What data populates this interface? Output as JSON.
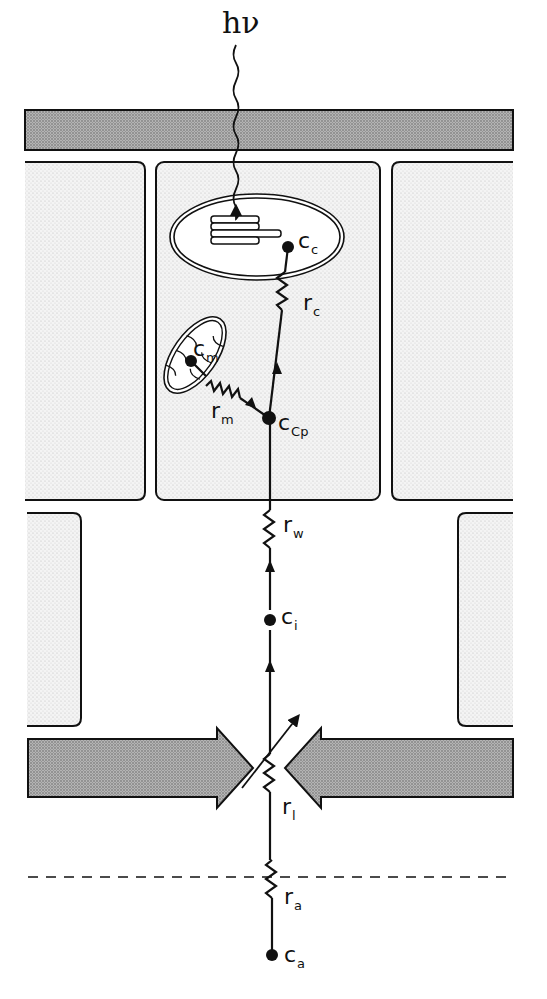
{
  "figure": {
    "type": "leaf CO2 diffusion resistance pathway",
    "incoming_light": "hν",
    "colors": {
      "stroke": "#111111",
      "cuticle_fill": "#a9a9a9",
      "cell_fill": "#ececec",
      "background": "#ffffff"
    }
  },
  "labels": {
    "light": "hν",
    "c_c": {
      "main": "c",
      "sub": "c"
    },
    "r_c": {
      "main": "r",
      "sub": "c"
    },
    "c_m": {
      "main": "c",
      "sub": "m"
    },
    "r_m": {
      "main": "r",
      "sub": "m"
    },
    "c_cp": {
      "main": "c",
      "sub": "Cp"
    },
    "r_w": {
      "main": "r",
      "sub": "w"
    },
    "c_i": {
      "main": "c",
      "sub": "i"
    },
    "r_l": {
      "main": "r",
      "sub": "l"
    },
    "r_a": {
      "main": "r",
      "sub": "a"
    },
    "c_a": {
      "main": "c",
      "sub": "a"
    }
  },
  "nodes": [
    {
      "id": "c_a",
      "label": "ca",
      "x": 272,
      "y": 955
    },
    {
      "id": "c_i",
      "label": "ci",
      "x": 269,
      "y": 620
    },
    {
      "id": "c_cp",
      "label": "cCp",
      "x": 269,
      "y": 418
    },
    {
      "id": "c_m",
      "label": "cm",
      "x": 191,
      "y": 361
    },
    {
      "id": "c_c",
      "label": "cc",
      "x": 288,
      "y": 247
    }
  ],
  "resistors": [
    {
      "id": "r_a",
      "label": "ra",
      "variable": false
    },
    {
      "id": "r_l",
      "label": "rl",
      "variable": true
    },
    {
      "id": "r_w",
      "label": "rw",
      "variable": false
    },
    {
      "id": "r_m",
      "label": "rm",
      "variable": false
    },
    {
      "id": "r_c",
      "label": "rc",
      "variable": false
    }
  ]
}
